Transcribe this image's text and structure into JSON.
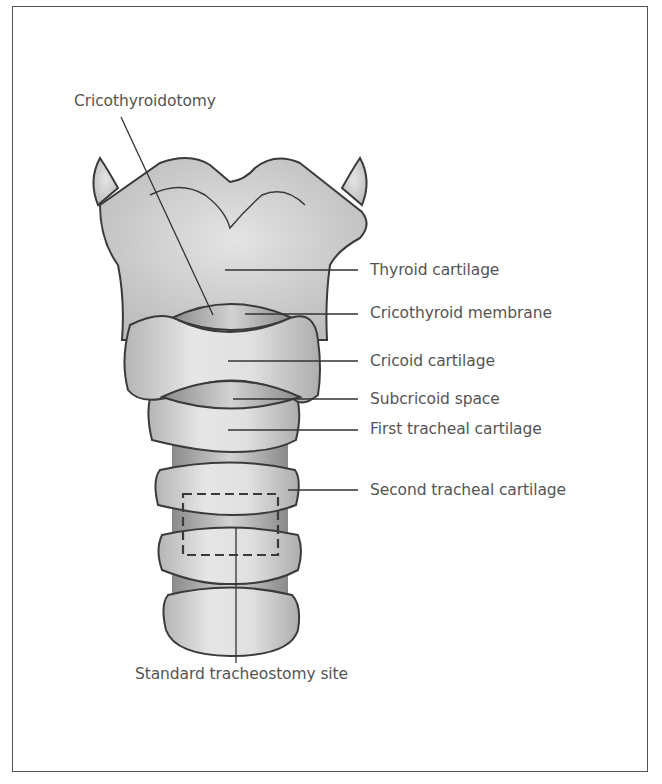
{
  "figure": {
    "labels": {
      "cricothyroidotomy": "Cricothyroidotomy",
      "thyroid_cartilage": "Thyroid cartilage",
      "cricothyroid_membrane": "Cricothyroid membrane",
      "cricoid_cartilage": "Cricoid cartilage",
      "subcricoid_space": "Subcricoid space",
      "first_tracheal_cartilage": "First tracheal cartilage",
      "second_tracheal_cartilage": "Second tracheal cartilage",
      "standard_tracheostomy_site": "Standard tracheostomy site"
    },
    "colors": {
      "outline": "#3a3a3a",
      "cartilage_fill": "#d9d9d9",
      "membrane_fill": "#a8a8a8",
      "text": "#555555"
    }
  }
}
